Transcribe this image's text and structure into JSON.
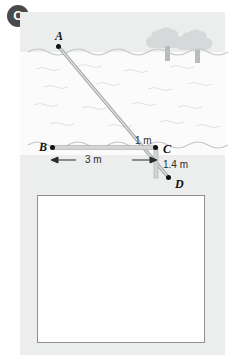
{
  "question": {
    "badge_label": "C"
  },
  "diagram": {
    "points": [
      {
        "id": "A",
        "label": "A",
        "x": 58,
        "y": 45,
        "description": "top of pole above water"
      },
      {
        "id": "B",
        "label": "B",
        "x": 50,
        "y": 147,
        "description": "left end of bed segment"
      },
      {
        "id": "C",
        "label": "C",
        "x": 155,
        "y": 147,
        "description": "right end of bed segment"
      },
      {
        "id": "D",
        "label": "D",
        "x": 168,
        "y": 177,
        "description": "bottom end of pole"
      }
    ],
    "measurements": [
      {
        "name": "BC",
        "label": "3 m",
        "value": 3,
        "unit": "m",
        "orientation": "horizontal"
      },
      {
        "name": "C-to-surface",
        "label": "1 m",
        "value": 1,
        "unit": "m",
        "orientation": "vertical"
      },
      {
        "name": "CD",
        "label": "1.4 m",
        "value": 1.4,
        "unit": "m",
        "orientation": "vertical"
      }
    ],
    "scene": {
      "water_label": "water",
      "trees_count": 2,
      "pole_from": "A",
      "pole_to": "D"
    }
  },
  "answer_area": {
    "value": "",
    "placeholder": ""
  },
  "colors": {
    "badge_bg": "#4a4a4a",
    "badge_text": "#ffffff",
    "panel_bg": "#eceded",
    "water_bg": "#fbfbfb",
    "wave_stroke": "#c9cbcc",
    "rod_fill": "#c6c8ca",
    "rod_stroke": "#9b9ea1",
    "tree_fill": "#d6d8d9",
    "dot_color": "#111111",
    "answer_border": "#8d8f92",
    "answer_bg": "#ffffff"
  }
}
